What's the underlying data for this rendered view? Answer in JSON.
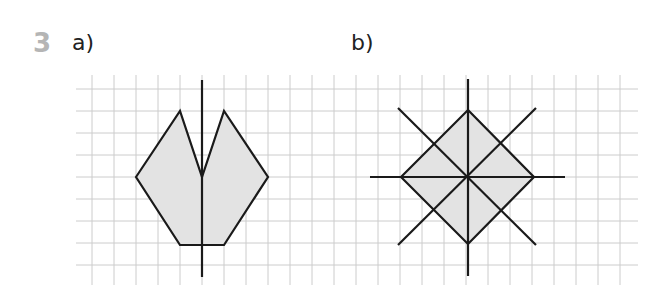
{
  "question": {
    "number": "3",
    "parts": [
      {
        "label": "a)"
      },
      {
        "label": "b)"
      }
    ]
  },
  "colors": {
    "question_number": "#b5b5b5",
    "grid_line": "#cccccc",
    "shape_fill": "#e3e3e3",
    "shape_stroke": "#1a1a1a",
    "axis": "#1a1a1a"
  },
  "grid": {
    "cell_size": 22,
    "x_start": 76,
    "x_end": 638,
    "y_start": 75,
    "y_end": 285
  },
  "figures": {
    "a": {
      "description": "Heptagon-like notched shape with one vertical line of symmetry",
      "polygon": [
        [
          136,
          177
        ],
        [
          180,
          111
        ],
        [
          202,
          177
        ],
        [
          224,
          111
        ],
        [
          268,
          177
        ],
        [
          224,
          245
        ],
        [
          180,
          245
        ]
      ],
      "symmetry_lines": [
        {
          "x1": 202,
          "y1": 80,
          "x2": 202,
          "y2": 277
        }
      ]
    },
    "b": {
      "description": "Square (diamond) with four lines of symmetry",
      "polygon": [
        [
          468,
          110
        ],
        [
          534,
          177
        ],
        [
          468,
          244
        ],
        [
          401,
          177
        ]
      ],
      "symmetry_lines": [
        {
          "x1": 468,
          "y1": 79,
          "x2": 468,
          "y2": 276
        },
        {
          "x1": 370,
          "y1": 177,
          "x2": 565,
          "y2": 177
        },
        {
          "x1": 398,
          "y1": 108,
          "x2": 536,
          "y2": 245
        },
        {
          "x1": 536,
          "y1": 108,
          "x2": 398,
          "y2": 245
        }
      ]
    }
  }
}
